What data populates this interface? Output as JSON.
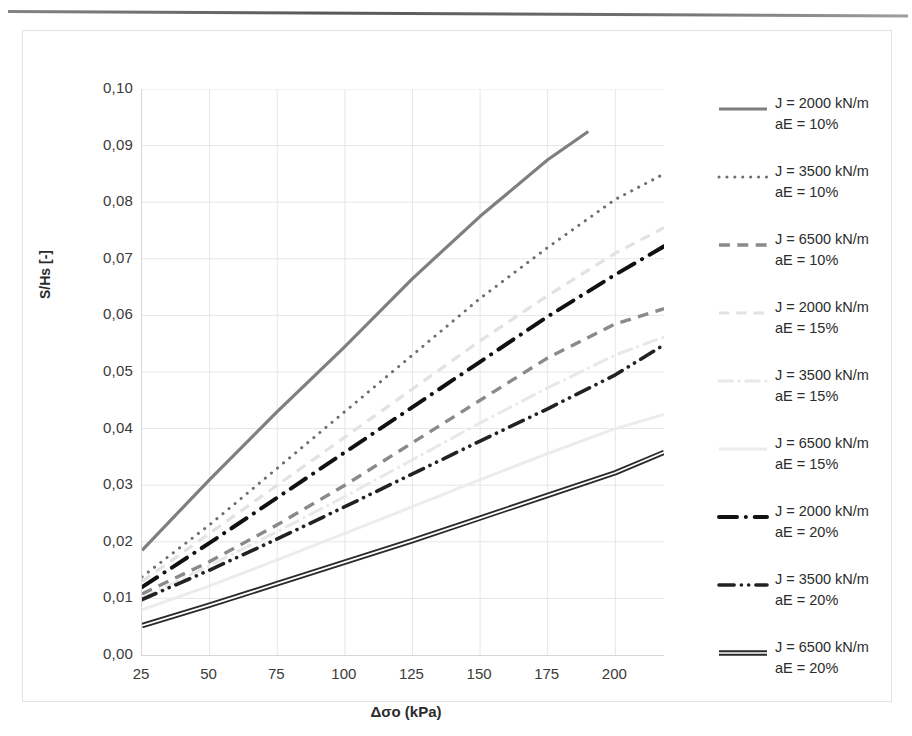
{
  "axes": {
    "y_title": "S/Hs [-]",
    "x_title": "Δσo (kPa)",
    "y_ticks": [
      "0,10",
      "0,09",
      "0,08",
      "0,07",
      "0,06",
      "0,05",
      "0,04",
      "0,03",
      "0,02",
      "0,01",
      "0,00"
    ],
    "x_ticks": [
      "25",
      "50",
      "75",
      "100",
      "125",
      "150",
      "175",
      "200"
    ]
  },
  "legend": {
    "items": [
      {
        "line1": "J = 2000 kN/m",
        "line2": "aE = 10%",
        "style": "solid",
        "color": "#7f7f7f",
        "width": 3.2
      },
      {
        "line1": "J = 3500 kN/m",
        "line2": "aE = 10%",
        "style": "dotted",
        "color": "#6e6e6e",
        "width": 3.0
      },
      {
        "line1": "J = 6500 kN/m",
        "line2": "aE = 10%",
        "style": "dashed",
        "color": "#8a8a8a",
        "width": 3.4
      },
      {
        "line1": "J = 2000 kN/m",
        "line2": "aE = 15%",
        "style": "dashed",
        "color": "#e2e2e2",
        "width": 3.2
      },
      {
        "line1": "J = 3500 kN/m",
        "line2": "aE = 15%",
        "style": "dashdot",
        "color": "#e8e8e8",
        "width": 3.0
      },
      {
        "line1": "J = 6500 kN/m",
        "line2": "aE = 15%",
        "style": "solid",
        "color": "#ececec",
        "width": 3.0
      },
      {
        "line1": "J = 2000 kN/m",
        "line2": "aE = 20%",
        "style": "dashdot",
        "color": "#111111",
        "width": 4.0
      },
      {
        "line1": "J = 3500 kN/m",
        "line2": "aE = 20%",
        "style": "dashdotdot",
        "color": "#222222",
        "width": 3.6
      },
      {
        "line1": "J = 6500 kN/m",
        "line2": "aE = 20%",
        "style": "double",
        "color": "#2a2a2a",
        "width": 3.2
      }
    ]
  },
  "chart_data": {
    "type": "line",
    "title": "",
    "xlabel": "Δσo (kPa)",
    "ylabel": "S/Hs [-]",
    "xlim": [
      25,
      218
    ],
    "ylim": [
      0.0,
      0.1
    ],
    "xticks": [
      25,
      50,
      75,
      100,
      125,
      150,
      175,
      200
    ],
    "yticks": [
      0.0,
      0.01,
      0.02,
      0.03,
      0.04,
      0.05,
      0.06,
      0.07,
      0.08,
      0.09,
      0.1
    ],
    "grid": true,
    "legend_position": "right",
    "x": [
      25,
      50,
      75,
      100,
      125,
      150,
      175,
      190,
      200,
      218
    ],
    "series": [
      {
        "name": "J = 2000 kN/m, aE = 10%",
        "style": "solid",
        "color": "#7f7f7f",
        "x": [
          25,
          50,
          75,
          100,
          125,
          150,
          175,
          190
        ],
        "values": [
          0.0185,
          0.031,
          0.043,
          0.0545,
          0.0665,
          0.0775,
          0.0875,
          0.0925
        ]
      },
      {
        "name": "J = 3500 kN/m, aE = 10%",
        "style": "dotted",
        "color": "#6e6e6e",
        "x": [
          25,
          50,
          75,
          100,
          125,
          150,
          175,
          200,
          218
        ],
        "values": [
          0.0138,
          0.023,
          0.033,
          0.043,
          0.053,
          0.063,
          0.072,
          0.0805,
          0.085
        ]
      },
      {
        "name": "J = 6500 kN/m, aE = 10%",
        "style": "dashed",
        "color": "#8a8a8a",
        "x": [
          25,
          50,
          75,
          100,
          125,
          150,
          175,
          200,
          218
        ],
        "values": [
          0.0108,
          0.0165,
          0.023,
          0.03,
          0.0375,
          0.045,
          0.0525,
          0.0585,
          0.0612
        ]
      },
      {
        "name": "J = 2000 kN/m, aE = 15%",
        "style": "dashed",
        "color": "#e2e2e2",
        "x": [
          25,
          50,
          75,
          100,
          125,
          150,
          175,
          200,
          218
        ],
        "values": [
          0.013,
          0.0215,
          0.03,
          0.0385,
          0.047,
          0.0555,
          0.0635,
          0.071,
          0.0755
        ]
      },
      {
        "name": "J = 3500 kN/m, aE = 15%",
        "style": "dashdot",
        "color": "#e8e8e8",
        "x": [
          25,
          50,
          75,
          100,
          125,
          150,
          175,
          200,
          218
        ],
        "values": [
          0.01,
          0.0158,
          0.0218,
          0.028,
          0.0345,
          0.041,
          0.0472,
          0.053,
          0.0562
        ]
      },
      {
        "name": "J = 6500 kN/m, aE = 15%",
        "style": "solid",
        "color": "#ececec",
        "x": [
          25,
          50,
          75,
          100,
          125,
          150,
          175,
          200,
          218
        ],
        "values": [
          0.008,
          0.0122,
          0.0168,
          0.0215,
          0.0262,
          0.031,
          0.0356,
          0.04,
          0.0425
        ]
      },
      {
        "name": "J = 2000 kN/m, aE = 20%",
        "style": "dashdot",
        "color": "#111111",
        "x": [
          25,
          50,
          75,
          100,
          125,
          150,
          175,
          200,
          218
        ],
        "values": [
          0.012,
          0.0198,
          0.0278,
          0.0358,
          0.0438,
          0.0518,
          0.0598,
          0.0672,
          0.0722
        ]
      },
      {
        "name": "J = 3500 kN/m, aE = 20%",
        "style": "dashdotdot",
        "color": "#222222",
        "x": [
          25,
          50,
          75,
          100,
          125,
          150,
          175,
          200,
          218
        ],
        "values": [
          0.0098,
          0.015,
          0.0205,
          0.0262,
          0.032,
          0.0378,
          0.0435,
          0.0495,
          0.0548
        ]
      },
      {
        "name": "J = 6500 kN/m, aE = 20%",
        "style": "double",
        "color": "#2a2a2a",
        "x": [
          25,
          50,
          75,
          100,
          125,
          150,
          175,
          200,
          218
        ],
        "values": [
          0.0052,
          0.0088,
          0.0126,
          0.0164,
          0.0202,
          0.0242,
          0.0282,
          0.0322,
          0.0358
        ]
      }
    ]
  }
}
